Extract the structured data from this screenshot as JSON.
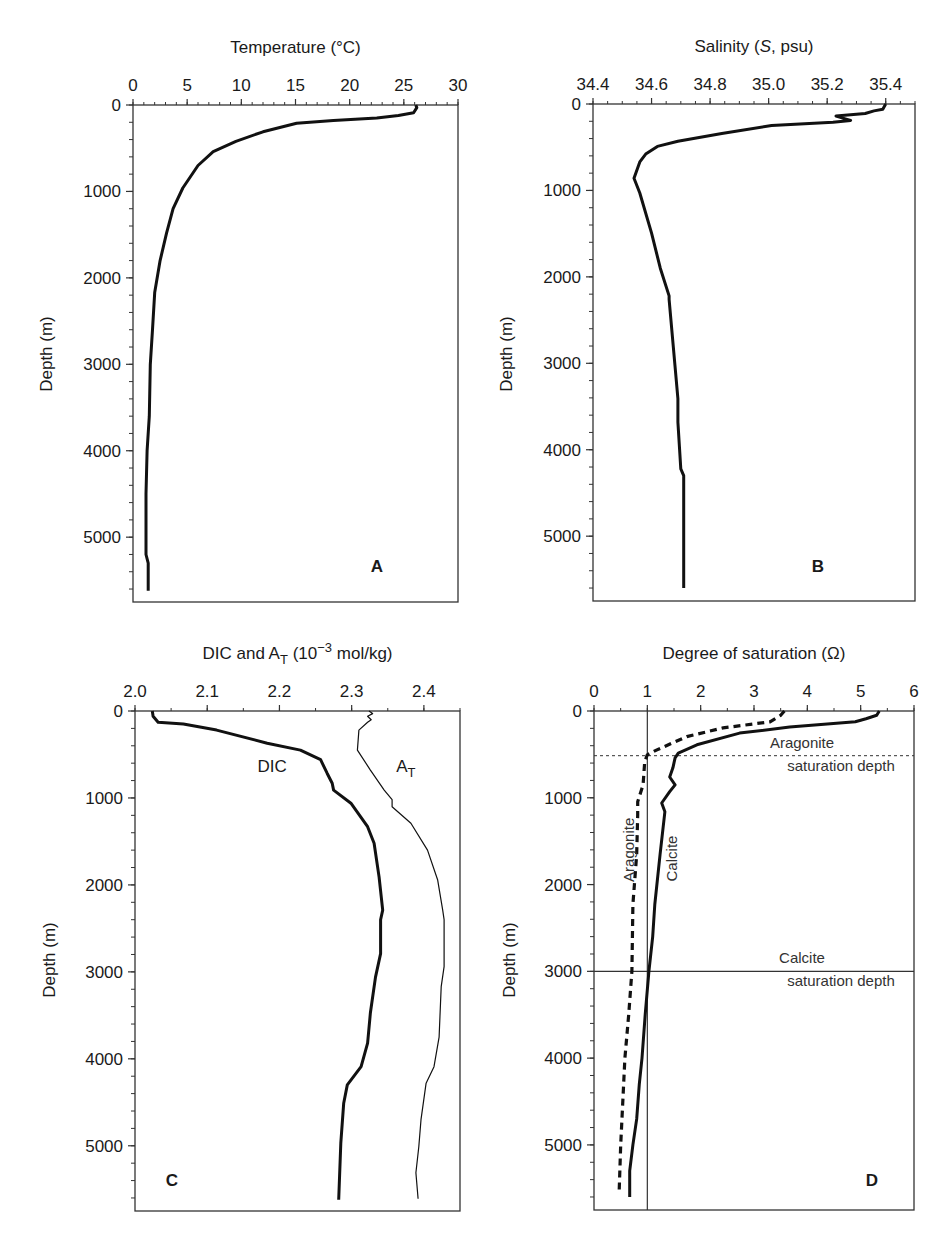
{
  "figure": {
    "background": "#ffffff",
    "line_color": "#111111",
    "frame_color": "#333333"
  },
  "chart_data": [
    {
      "id": "A",
      "type": "line",
      "panel_letter": "A",
      "title": "",
      "xlabel": "Temperature (°C)",
      "ylabel": "Depth (m)",
      "xlim": [
        0,
        30
      ],
      "ylim": [
        5750,
        0
      ],
      "x_ticks": [
        0,
        5,
        10,
        15,
        20,
        25,
        30
      ],
      "x_tick_labels": [
        "0",
        "5",
        "10",
        "15",
        "20",
        "25",
        "30"
      ],
      "x_minor_step": 1,
      "y_ticks": [
        0,
        1000,
        2000,
        3000,
        4000,
        5000
      ],
      "y_tick_labels": [
        "0",
        "1000",
        "2000",
        "3000",
        "4000",
        "5000"
      ],
      "y_minor_step": 200,
      "x_axis_position": "top",
      "grid": false,
      "legend": null,
      "series": [
        {
          "name": "Temperature",
          "style": "solid-thick",
          "points": [
            [
              26.1,
              0
            ],
            [
              26.2,
              30
            ],
            [
              25.9,
              90
            ],
            [
              24.5,
              120
            ],
            [
              22.5,
              150
            ],
            [
              18.5,
              180
            ],
            [
              15.1,
              210
            ],
            [
              12.0,
              310
            ],
            [
              9.5,
              420
            ],
            [
              7.4,
              540
            ],
            [
              6.0,
              700
            ],
            [
              4.6,
              960
            ],
            [
              3.7,
              1200
            ],
            [
              3.1,
              1480
            ],
            [
              2.5,
              1800
            ],
            [
              2.0,
              2170
            ],
            [
              1.8,
              2600
            ],
            [
              1.6,
              3000
            ],
            [
              1.5,
              3600
            ],
            [
              1.3,
              4000
            ],
            [
              1.2,
              4500
            ],
            [
              1.2,
              5200
            ],
            [
              1.4,
              5300
            ],
            [
              1.4,
              5620
            ]
          ]
        }
      ],
      "annotations": []
    },
    {
      "id": "B",
      "type": "line",
      "panel_letter": "B",
      "xlabel": "Salinity (S, psu)",
      "xlabel_parts": [
        "Salinity (",
        "S",
        ", psu)"
      ],
      "ylabel": "Depth (m)",
      "xlim": [
        34.4,
        35.5
      ],
      "ylim": [
        5750,
        0
      ],
      "x_ticks": [
        34.4,
        34.6,
        34.8,
        35.0,
        35.2,
        35.4
      ],
      "x_tick_labels": [
        "34.4",
        "34.6",
        "34.8",
        "35.0",
        "35.2",
        "35.4"
      ],
      "x_minor_step": 0.05,
      "y_ticks": [
        0,
        1000,
        2000,
        3000,
        4000,
        5000
      ],
      "y_tick_labels": [
        "0",
        "1000",
        "2000",
        "3000",
        "4000",
        "5000"
      ],
      "y_minor_step": 200,
      "x_axis_position": "top",
      "grid": false,
      "legend": null,
      "series": [
        {
          "name": "Salinity",
          "style": "solid-thick",
          "points": [
            [
              35.4,
              0
            ],
            [
              35.39,
              60
            ],
            [
              35.36,
              80
            ],
            [
              35.33,
              110
            ],
            [
              35.23,
              140
            ],
            [
              35.28,
              190
            ],
            [
              35.22,
              210
            ],
            [
              35.01,
              250
            ],
            [
              34.84,
              340
            ],
            [
              34.69,
              430
            ],
            [
              34.62,
              490
            ],
            [
              34.58,
              580
            ],
            [
              34.56,
              670
            ],
            [
              34.54,
              860
            ],
            [
              34.56,
              1030
            ],
            [
              34.6,
              1490
            ],
            [
              34.63,
              1900
            ],
            [
              34.66,
              2220
            ],
            [
              34.66,
              2260
            ],
            [
              34.68,
              3030
            ],
            [
              34.69,
              3410
            ],
            [
              34.69,
              3680
            ],
            [
              34.7,
              4220
            ],
            [
              34.71,
              4300
            ],
            [
              34.71,
              5600
            ]
          ]
        }
      ],
      "annotations": []
    },
    {
      "id": "C",
      "type": "line",
      "panel_letter": "C",
      "xlabel": "DIC and A_T (10^-3 mol/kg)",
      "xlabel_parts": {
        "a": "DIC and A",
        "sub": "T",
        "b": " (10",
        "sup": "−3",
        "c": " mol/kg)"
      },
      "ylabel": "Depth (m)",
      "xlim": [
        2.0,
        2.45
      ],
      "ylim": [
        5750,
        0
      ],
      "x_ticks": [
        2.0,
        2.1,
        2.2,
        2.3,
        2.4
      ],
      "x_tick_labels": [
        "2.0",
        "2.1",
        "2.2",
        "2.3",
        "2.4"
      ],
      "x_minor_step": 0.05,
      "y_ticks": [
        0,
        1000,
        2000,
        3000,
        4000,
        5000
      ],
      "y_tick_labels": [
        "0",
        "1000",
        "2000",
        "3000",
        "4000",
        "5000"
      ],
      "y_minor_step": 200,
      "x_axis_position": "top",
      "grid": false,
      "legend": null,
      "series": [
        {
          "name": "DIC",
          "style": "solid-thick",
          "points": [
            [
              2.024,
              0
            ],
            [
              2.025,
              60
            ],
            [
              2.032,
              130
            ],
            [
              2.067,
              150
            ],
            [
              2.113,
              220
            ],
            [
              2.183,
              370
            ],
            [
              2.229,
              450
            ],
            [
              2.257,
              560
            ],
            [
              2.266,
              715
            ],
            [
              2.273,
              830
            ],
            [
              2.275,
              910
            ],
            [
              2.299,
              1060
            ],
            [
              2.322,
              1330
            ],
            [
              2.331,
              1520
            ],
            [
              2.338,
              1910
            ],
            [
              2.343,
              2290
            ],
            [
              2.34,
              2400
            ],
            [
              2.34,
              2790
            ],
            [
              2.333,
              3060
            ],
            [
              2.326,
              3470
            ],
            [
              2.322,
              3820
            ],
            [
              2.313,
              4090
            ],
            [
              2.294,
              4300
            ],
            [
              2.289,
              4510
            ],
            [
              2.285,
              4970
            ],
            [
              2.282,
              5620
            ]
          ]
        },
        {
          "name": "A_T",
          "style": "solid-thin",
          "points": [
            [
              2.324,
              0
            ],
            [
              2.329,
              30
            ],
            [
              2.322,
              60
            ],
            [
              2.327,
              100
            ],
            [
              2.322,
              130
            ],
            [
              2.31,
              220
            ],
            [
              2.308,
              450
            ],
            [
              2.326,
              680
            ],
            [
              2.345,
              910
            ],
            [
              2.356,
              1020
            ],
            [
              2.356,
              1100
            ],
            [
              2.382,
              1290
            ],
            [
              2.405,
              1600
            ],
            [
              2.419,
              1940
            ],
            [
              2.426,
              2290
            ],
            [
              2.428,
              2400
            ],
            [
              2.428,
              2940
            ],
            [
              2.424,
              3170
            ],
            [
              2.421,
              3750
            ],
            [
              2.414,
              4090
            ],
            [
              2.403,
              4280
            ],
            [
              2.396,
              4700
            ],
            [
              2.393,
              5010
            ],
            [
              2.389,
              5310
            ],
            [
              2.392,
              5610
            ]
          ]
        }
      ],
      "annotations": [
        {
          "text": "DIC",
          "x": 2.19,
          "y": 700
        },
        {
          "text": "A",
          "sub": "T",
          "x": 2.375,
          "y": 700
        }
      ]
    },
    {
      "id": "D",
      "type": "line",
      "panel_letter": "D",
      "xlabel": "Degree of saturation (Ω)",
      "ylabel": "Depth (m)",
      "xlim": [
        0,
        6
      ],
      "ylim": [
        5750,
        0
      ],
      "x_ticks": [
        0,
        1,
        2,
        3,
        4,
        5,
        6
      ],
      "x_tick_labels": [
        "0",
        "1",
        "2",
        "3",
        "4",
        "5",
        "6"
      ],
      "x_minor_step": 0.5,
      "y_ticks": [
        0,
        1000,
        2000,
        3000,
        4000,
        5000
      ],
      "y_tick_labels": [
        "0",
        "1000",
        "2000",
        "3000",
        "4000",
        "5000"
      ],
      "y_minor_step": 200,
      "x_axis_position": "top",
      "grid": false,
      "legend": null,
      "reference_lines": [
        {
          "name": "omega-equals-one",
          "orientation": "vertical",
          "value": 1,
          "style": "solid-thin"
        },
        {
          "name": "aragonite-saturation-depth",
          "orientation": "horizontal",
          "value": 515,
          "style": "dotted",
          "label_lines": [
            "Aragonite",
            "saturation depth"
          ]
        },
        {
          "name": "calcite-saturation-depth",
          "orientation": "horizontal",
          "value": 3000,
          "style": "solid-thin",
          "label_lines": [
            "Calcite",
            "saturation depth"
          ]
        }
      ],
      "series": [
        {
          "name": "Calcite",
          "style": "solid-thick",
          "points": [
            [
              5.35,
              0
            ],
            [
              5.3,
              50
            ],
            [
              5.1,
              90
            ],
            [
              4.9,
              125
            ],
            [
              3.67,
              185
            ],
            [
              2.73,
              255
            ],
            [
              1.93,
              390
            ],
            [
              1.58,
              485
            ],
            [
              1.52,
              540
            ],
            [
              1.48,
              655
            ],
            [
              1.42,
              760
            ],
            [
              1.52,
              850
            ],
            [
              1.42,
              930
            ],
            [
              1.27,
              1060
            ],
            [
              1.33,
              1160
            ],
            [
              1.24,
              1650
            ],
            [
              1.14,
              2230
            ],
            [
              1.1,
              2600
            ],
            [
              1.03,
              3000
            ],
            [
              0.96,
              3500
            ],
            [
              0.9,
              4000
            ],
            [
              0.85,
              4300
            ],
            [
              0.8,
              4700
            ],
            [
              0.73,
              5000
            ],
            [
              0.67,
              5300
            ],
            [
              0.67,
              5600
            ]
          ]
        },
        {
          "name": "Aragonite",
          "style": "dashed-thick",
          "points": [
            [
              3.57,
              0
            ],
            [
              3.5,
              50
            ],
            [
              3.3,
              125
            ],
            [
              2.42,
              195
            ],
            [
              1.74,
              295
            ],
            [
              1.17,
              450
            ],
            [
              1.0,
              505
            ],
            [
              0.95,
              585
            ],
            [
              0.92,
              850
            ],
            [
              0.82,
              1045
            ],
            [
              0.82,
              1195
            ],
            [
              0.8,
              1650
            ],
            [
              0.73,
              2230
            ],
            [
              0.71,
              3000
            ],
            [
              0.65,
              3500
            ],
            [
              0.58,
              4000
            ],
            [
              0.54,
              4500
            ],
            [
              0.5,
              5000
            ],
            [
              0.47,
              5560
            ]
          ]
        }
      ],
      "annotations": [
        {
          "text": "Aragonite",
          "x": 0.75,
          "y": 1600,
          "rotate": -90
        },
        {
          "text": "Calcite",
          "x": 1.55,
          "y": 1700,
          "rotate": -90
        }
      ]
    }
  ]
}
